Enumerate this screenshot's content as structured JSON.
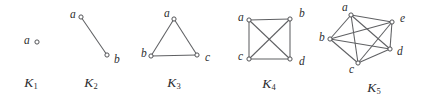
{
  "figure": {
    "background_color": "#ffffff",
    "edge_color": "#5f6063",
    "vertex_fill": "#ffffff",
    "vertex_stroke": "#4a4b4e",
    "label_color": "#2e2f31",
    "vertex_radius": 2.1
  },
  "graphs": [
    {
      "id": "k1",
      "caption_letter": "K",
      "caption_subscript": "1",
      "caption_x": 31,
      "caption_y": 84,
      "vertices": [
        {
          "name": "a",
          "label": "a",
          "cx": 37,
          "cy": 42,
          "label_x": 24,
          "label_y": 41
        }
      ],
      "edges": []
    },
    {
      "id": "k2",
      "caption_letter": "K",
      "caption_subscript": "2",
      "caption_x": 91,
      "caption_y": 84,
      "vertices": [
        {
          "name": "a",
          "label": "a",
          "cx": 81,
          "cy": 17,
          "label_x": 70,
          "label_y": 15
        },
        {
          "name": "b",
          "label": "b",
          "cx": 107,
          "cy": 55,
          "label_x": 114,
          "label_y": 60
        }
      ],
      "edges": [
        {
          "from": "a",
          "to": "b"
        }
      ]
    },
    {
      "id": "k3",
      "caption_letter": "K",
      "caption_subscript": "3",
      "caption_x": 174,
      "caption_y": 84,
      "vertices": [
        {
          "name": "a",
          "label": "a",
          "cx": 174,
          "cy": 19,
          "label_x": 164,
          "label_y": 14
        },
        {
          "name": "b",
          "label": "b",
          "cx": 151,
          "cy": 56,
          "label_x": 141,
          "label_y": 54
        },
        {
          "name": "c",
          "label": "c",
          "cx": 197,
          "cy": 55,
          "label_x": 205,
          "label_y": 58
        }
      ],
      "edges": [
        {
          "from": "a",
          "to": "b"
        },
        {
          "from": "a",
          "to": "c"
        },
        {
          "from": "b",
          "to": "c"
        }
      ]
    },
    {
      "id": "k4",
      "caption_letter": "K",
      "caption_subscript": "4",
      "caption_x": 269,
      "caption_y": 85,
      "vertices": [
        {
          "name": "a",
          "label": "a",
          "cx": 249,
          "cy": 20,
          "label_x": 238,
          "label_y": 18
        },
        {
          "name": "b",
          "label": "b",
          "cx": 290,
          "cy": 19,
          "label_x": 299,
          "label_y": 14
        },
        {
          "name": "c",
          "label": "c",
          "cx": 249,
          "cy": 59,
          "label_x": 238,
          "label_y": 57
        },
        {
          "name": "d",
          "label": "d",
          "cx": 290,
          "cy": 59,
          "label_x": 299,
          "label_y": 62
        }
      ],
      "edges": [
        {
          "from": "a",
          "to": "b"
        },
        {
          "from": "a",
          "to": "c"
        },
        {
          "from": "a",
          "to": "d"
        },
        {
          "from": "b",
          "to": "c"
        },
        {
          "from": "b",
          "to": "d"
        },
        {
          "from": "c",
          "to": "d"
        }
      ]
    },
    {
      "id": "k5",
      "caption_letter": "K",
      "caption_subscript": "5",
      "caption_x": 374,
      "caption_y": 89,
      "vertices": [
        {
          "name": "a",
          "label": "a",
          "cx": 351,
          "cy": 15,
          "label_x": 342,
          "label_y": 8
        },
        {
          "name": "b",
          "label": "b",
          "cx": 330,
          "cy": 39,
          "label_x": 319,
          "label_y": 38
        },
        {
          "name": "c",
          "label": "c",
          "cx": 358,
          "cy": 63,
          "label_x": 349,
          "label_y": 70
        },
        {
          "name": "d",
          "label": "d",
          "cx": 390,
          "cy": 49,
          "label_x": 397,
          "label_y": 52
        },
        {
          "name": "e",
          "label": "e",
          "cx": 392,
          "cy": 22,
          "label_x": 400,
          "label_y": 19
        }
      ],
      "edges": [
        {
          "from": "a",
          "to": "b"
        },
        {
          "from": "a",
          "to": "c"
        },
        {
          "from": "a",
          "to": "d"
        },
        {
          "from": "a",
          "to": "e"
        },
        {
          "from": "b",
          "to": "c"
        },
        {
          "from": "b",
          "to": "d"
        },
        {
          "from": "b",
          "to": "e"
        },
        {
          "from": "c",
          "to": "d"
        },
        {
          "from": "c",
          "to": "e"
        },
        {
          "from": "d",
          "to": "e"
        }
      ]
    }
  ]
}
